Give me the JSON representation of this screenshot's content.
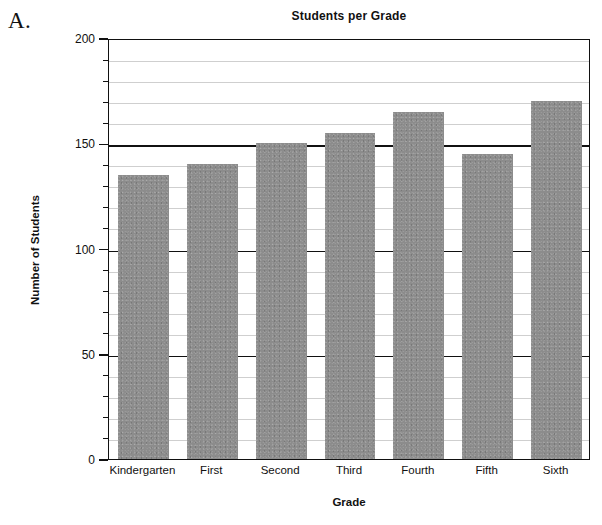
{
  "figure": {
    "label": "A."
  },
  "chart_data": {
    "type": "bar",
    "title": "Students per Grade",
    "xlabel": "Grade",
    "ylabel": "Number of Students",
    "categories": [
      "Kindergarten",
      "First",
      "Second",
      "Third",
      "Fourth",
      "Fifth",
      "Sixth"
    ],
    "values": [
      135,
      140,
      150,
      155,
      165,
      145,
      170
    ],
    "ylim": [
      0,
      200
    ],
    "ytick_labels": [
      "0",
      "50",
      "100",
      "150",
      "200"
    ],
    "ytick_values": [
      0,
      50,
      100,
      150,
      200
    ],
    "yminor_step": 10,
    "grid": true,
    "legend": null,
    "bar_color": "#8c8c8c",
    "axis_color": "#111111",
    "gridline_color": "#cfcfcf"
  }
}
